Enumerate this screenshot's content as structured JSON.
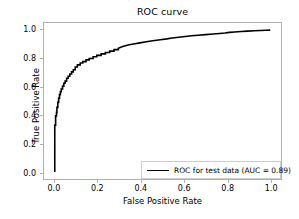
{
  "chart_data": {
    "type": "line",
    "title": "ROC curve",
    "xlabel": "False Positive Rate",
    "ylabel": "True Positive Rate",
    "xlim": [
      -0.05,
      1.05
    ],
    "ylim": [
      -0.05,
      1.05
    ],
    "grid": false,
    "legend_position": "lower right",
    "xticks": [
      "0.0",
      "0.2",
      "0.4",
      "0.6",
      "0.8",
      "1.0"
    ],
    "xtick_values": [
      0.0,
      0.2,
      0.4,
      0.6,
      0.8,
      1.0
    ],
    "yticks": [
      "0.0",
      "0.2",
      "0.4",
      "0.6",
      "0.8",
      "1.0"
    ],
    "ytick_values": [
      0.0,
      0.2,
      0.4,
      0.6,
      0.8,
      1.0
    ],
    "series": [
      {
        "name": "ROC for test data (AUC = 0.89)",
        "color": "#000000",
        "auc": 0.89,
        "x": [
          0.0,
          0.0,
          0.004,
          0.004,
          0.008,
          0.008,
          0.01,
          0.01,
          0.014,
          0.014,
          0.018,
          0.018,
          0.022,
          0.022,
          0.026,
          0.026,
          0.03,
          0.03,
          0.036,
          0.036,
          0.042,
          0.042,
          0.048,
          0.048,
          0.055,
          0.055,
          0.062,
          0.062,
          0.07,
          0.07,
          0.078,
          0.078,
          0.086,
          0.086,
          0.095,
          0.095,
          0.105,
          0.105,
          0.118,
          0.118,
          0.13,
          0.13,
          0.145,
          0.145,
          0.16,
          0.16,
          0.178,
          0.178,
          0.195,
          0.195,
          0.215,
          0.215,
          0.235,
          0.235,
          0.255,
          0.255,
          0.275,
          0.275,
          0.295,
          0.295,
          0.315,
          0.34,
          0.365,
          0.395,
          0.425,
          0.455,
          0.49,
          0.52,
          0.545,
          0.575,
          0.605,
          0.635,
          0.665,
          0.7,
          0.735,
          0.765,
          0.79,
          0.81,
          0.835,
          0.865,
          0.895,
          0.925,
          0.955,
          0.98,
          1.0
        ],
        "y": [
          0.0,
          0.33,
          0.33,
          0.395,
          0.395,
          0.42,
          0.42,
          0.455,
          0.455,
          0.49,
          0.49,
          0.52,
          0.52,
          0.545,
          0.545,
          0.565,
          0.565,
          0.585,
          0.585,
          0.605,
          0.605,
          0.625,
          0.625,
          0.64,
          0.64,
          0.66,
          0.66,
          0.675,
          0.675,
          0.69,
          0.69,
          0.705,
          0.705,
          0.72,
          0.72,
          0.74,
          0.74,
          0.755,
          0.755,
          0.768,
          0.768,
          0.778,
          0.778,
          0.79,
          0.79,
          0.8,
          0.8,
          0.812,
          0.812,
          0.822,
          0.822,
          0.832,
          0.832,
          0.842,
          0.842,
          0.852,
          0.852,
          0.862,
          0.862,
          0.872,
          0.885,
          0.895,
          0.902,
          0.91,
          0.918,
          0.925,
          0.932,
          0.938,
          0.944,
          0.95,
          0.955,
          0.96,
          0.964,
          0.968,
          0.972,
          0.976,
          0.98,
          0.984,
          0.987,
          0.99,
          0.993,
          0.995,
          0.997,
          0.999,
          1.0
        ]
      }
    ]
  },
  "legend": {
    "entry_label": "ROC for test data (AUC = 0.89)"
  }
}
